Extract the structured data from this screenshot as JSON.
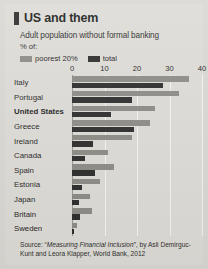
{
  "header": {
    "title": "US and them",
    "subtitle": "Adult population without formal banking",
    "unit": "% of:"
  },
  "legend": {
    "position": "top",
    "items": [
      {
        "label": "poorest 20%",
        "color": "#8c8a85"
      },
      {
        "label": "total",
        "color": "#2b2b2b"
      }
    ]
  },
  "source": {
    "prefix": "Source: “",
    "italic": "Measuring Financial Inclusion",
    "suffix": "”, by Asli Demirguc-Kunt and Leora Klapper, World Bank, 2012"
  },
  "colors": {
    "background": "#dddbd6",
    "poorest": "#8c8a85",
    "total": "#2b2b2b",
    "gridline": "#f4f3f0",
    "axis": "#9a978f",
    "text": "#1f1f1f"
  },
  "chart_data": {
    "type": "bar",
    "orientation": "horizontal",
    "title": "US and them",
    "subtitle": "Adult population without formal banking",
    "xlabel": "% of:",
    "ylabel": "",
    "xlim": [
      0,
      40
    ],
    "xticks": [
      0,
      10,
      20,
      30,
      40
    ],
    "ticklabels": [
      "0",
      "10",
      "20",
      "30",
      "40"
    ],
    "grid": true,
    "legend_position": "top",
    "categories": [
      "Italy",
      "Portugal",
      "United States",
      "Greece",
      "Ireland",
      "Canada",
      "Spain",
      "Estonia",
      "Japan",
      "Britain",
      "Sweden"
    ],
    "highlight": "United States",
    "series": [
      {
        "name": "poorest 20%",
        "color": "#8c8a85",
        "values": [
          36,
          33,
          25.5,
          24,
          18.5,
          11,
          13,
          8.5,
          5.5,
          6,
          1.5
        ]
      },
      {
        "name": "total",
        "color": "#2b2b2b",
        "values": [
          28,
          18.5,
          12,
          19,
          6.5,
          4,
          7,
          3,
          2,
          2.5,
          0.5
        ]
      }
    ]
  }
}
